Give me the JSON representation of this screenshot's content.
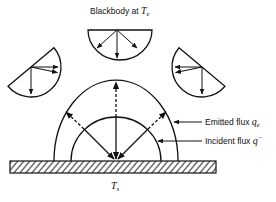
{
  "title": {
    "text": "Blackbody at ",
    "variable": "T",
    "subscript": "e"
  },
  "surface": {
    "variable": "T",
    "subscript": "s"
  },
  "labels": {
    "emitted": {
      "text": "Emitted flux ",
      "variable": "q",
      "subscript": "e"
    },
    "incident": {
      "text": "Incident flux ",
      "variable": "q",
      "superscript": "−"
    }
  },
  "elements": {
    "blackbody_hemispheres": 3,
    "outer_hemisphere": "emitted flux",
    "inner_hemisphere": "incident flux",
    "surface": "hatched plate"
  }
}
